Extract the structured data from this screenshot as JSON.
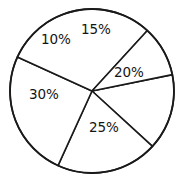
{
  "chart_data": {
    "type": "pie",
    "title": "",
    "subtitle": "",
    "xlabel": "",
    "ylabel": "",
    "legend": "none",
    "grid": false,
    "categories": [
      "15%",
      "20%",
      "25%",
      "30%",
      "10%"
    ],
    "values": [
      15,
      20,
      25,
      30,
      10
    ],
    "labels": [
      "15%",
      "20%",
      "25%",
      "30%",
      "10%"
    ],
    "slices": [
      {
        "label": "15%",
        "value": 15,
        "start_deg": -11.5,
        "end_deg": 42.5,
        "color": "#ffffff"
      },
      {
        "label": "20%",
        "value": 20,
        "start_deg": 42.5,
        "end_deg": 114.5,
        "color": "#ffffff"
      },
      {
        "label": "25%",
        "value": 25,
        "start_deg": 114.5,
        "end_deg": 204.5,
        "color": "#ffffff"
      },
      {
        "label": "30%",
        "value": 30,
        "start_deg": 204.5,
        "end_deg": 312.5,
        "color": "#ffffff"
      },
      {
        "label": "10%",
        "value": 10,
        "start_deg": 312.5,
        "end_deg": 348.5,
        "color": "#ffffff"
      }
    ],
    "total": 100,
    "units": "percent",
    "stroke_color": "#1a1a1a",
    "background_color": "#ffffff"
  },
  "geometry": {
    "center_x": 92,
    "center_y": 91,
    "radius": 82
  }
}
